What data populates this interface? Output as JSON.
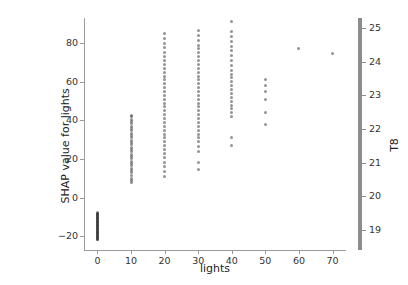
{
  "chart_data": {
    "type": "scatter",
    "title": "",
    "xlabel": "lights",
    "ylabel": "SHAP value for lights",
    "colorbar_label": "T8",
    "xlim": [
      -4,
      74
    ],
    "ylim": [
      -27,
      93
    ],
    "xticks": [
      0,
      10,
      20,
      30,
      40,
      50,
      60,
      70
    ],
    "xticklabels": [
      "0",
      "10",
      "20",
      "30",
      "40",
      "50",
      "60",
      "70"
    ],
    "yticks": [
      -20,
      0,
      20,
      40,
      60,
      80
    ],
    "yticklabels": [
      "−20",
      "0",
      "20",
      "40",
      "60",
      "80"
    ],
    "colorbar_ticks": [
      19,
      20,
      21,
      22,
      23,
      24,
      25
    ],
    "colorbar_ticklabels": [
      "19",
      "20",
      "21",
      "22",
      "23",
      "24",
      "25"
    ],
    "colorbar_range": [
      18.4,
      25.3
    ],
    "grid": false,
    "legend": false,
    "marker_color": "#3b3b3b",
    "marker_opacity": 0.55,
    "spine_color": "#9a9a9a",
    "series": [
      {
        "name": "SHAP values",
        "points": [
          {
            "x": 0,
            "y": -21.8,
            "c": 21.0
          },
          {
            "x": 0,
            "y": -21.4,
            "c": 20.4
          },
          {
            "x": 0,
            "y": -21.1,
            "c": 22.1
          },
          {
            "x": 0,
            "y": -20.8,
            "c": 19.8
          },
          {
            "x": 0,
            "y": -20.5,
            "c": 23.0
          },
          {
            "x": 0,
            "y": -20.2,
            "c": 21.5
          },
          {
            "x": 0,
            "y": -19.9,
            "c": 20.1
          },
          {
            "x": 0,
            "y": -19.6,
            "c": 22.7
          },
          {
            "x": 0,
            "y": -19.3,
            "c": 19.4
          },
          {
            "x": 0,
            "y": -19.0,
            "c": 23.6
          },
          {
            "x": 0,
            "y": -18.7,
            "c": 21.8
          },
          {
            "x": 0,
            "y": -18.4,
            "c": 20.7
          },
          {
            "x": 0,
            "y": -18.1,
            "c": 22.3
          },
          {
            "x": 0,
            "y": -17.8,
            "c": 19.1
          },
          {
            "x": 0,
            "y": -17.5,
            "c": 24.1
          },
          {
            "x": 0,
            "y": -17.2,
            "c": 21.2
          },
          {
            "x": 0,
            "y": -16.9,
            "c": 20.9
          },
          {
            "x": 0,
            "y": -16.6,
            "c": 22.9
          },
          {
            "x": 0,
            "y": -16.3,
            "c": 19.7
          },
          {
            "x": 0,
            "y": -16.0,
            "c": 23.3
          },
          {
            "x": 0,
            "y": -15.7,
            "c": 21.6
          },
          {
            "x": 0,
            "y": -15.4,
            "c": 20.3
          },
          {
            "x": 0,
            "y": -15.1,
            "c": 22.5
          },
          {
            "x": 0,
            "y": -14.8,
            "c": 19.5
          },
          {
            "x": 0,
            "y": -14.5,
            "c": 24.4
          },
          {
            "x": 0,
            "y": -14.2,
            "c": 21.1
          },
          {
            "x": 0,
            "y": -13.9,
            "c": 20.6
          },
          {
            "x": 0,
            "y": -13.6,
            "c": 23.1
          },
          {
            "x": 0,
            "y": -13.3,
            "c": 19.9
          },
          {
            "x": 0,
            "y": -13.0,
            "c": 22.0
          },
          {
            "x": 0,
            "y": -12.7,
            "c": 21.4
          },
          {
            "x": 0,
            "y": -12.4,
            "c": 20.0
          },
          {
            "x": 0,
            "y": -12.1,
            "c": 23.8
          },
          {
            "x": 0,
            "y": -11.8,
            "c": 19.2
          },
          {
            "x": 0,
            "y": -11.5,
            "c": 22.4
          },
          {
            "x": 0,
            "y": -11.2,
            "c": 21.7
          },
          {
            "x": 0,
            "y": -10.9,
            "c": 20.5
          },
          {
            "x": 0,
            "y": -10.6,
            "c": 23.4
          },
          {
            "x": 0,
            "y": -10.3,
            "c": 19.6
          },
          {
            "x": 0,
            "y": -10.0,
            "c": 22.2
          },
          {
            "x": 0,
            "y": -9.7,
            "c": 21.3
          },
          {
            "x": 0,
            "y": -9.4,
            "c": 20.8
          },
          {
            "x": 0,
            "y": -9.1,
            "c": 24.0
          },
          {
            "x": 0,
            "y": -8.8,
            "c": 19.3
          },
          {
            "x": 0,
            "y": -8.5,
            "c": 22.6
          },
          {
            "x": 0,
            "y": -8.2,
            "c": 21.9
          },
          {
            "x": 0,
            "y": -7.9,
            "c": 20.2
          },
          {
            "x": 0,
            "y": -7.6,
            "c": 23.2
          },
          {
            "x": 10,
            "y": 7.8,
            "c": 20.1
          },
          {
            "x": 10,
            "y": 9.0,
            "c": 21.3
          },
          {
            "x": 10,
            "y": 10.1,
            "c": 22.0
          },
          {
            "x": 10,
            "y": 11.5,
            "c": 19.8
          },
          {
            "x": 10,
            "y": 13.0,
            "c": 23.1
          },
          {
            "x": 10,
            "y": 14.2,
            "c": 20.6
          },
          {
            "x": 10,
            "y": 15.4,
            "c": 21.8
          },
          {
            "x": 10,
            "y": 16.6,
            "c": 22.5
          },
          {
            "x": 10,
            "y": 17.8,
            "c": 19.4
          },
          {
            "x": 10,
            "y": 19.0,
            "c": 23.5
          },
          {
            "x": 10,
            "y": 20.2,
            "c": 21.0
          },
          {
            "x": 10,
            "y": 21.4,
            "c": 20.4
          },
          {
            "x": 10,
            "y": 22.6,
            "c": 22.8
          },
          {
            "x": 10,
            "y": 23.8,
            "c": 19.6
          },
          {
            "x": 10,
            "y": 25.0,
            "c": 21.5
          },
          {
            "x": 10,
            "y": 26.2,
            "c": 23.0
          },
          {
            "x": 10,
            "y": 27.4,
            "c": 20.9
          },
          {
            "x": 10,
            "y": 28.6,
            "c": 22.2
          },
          {
            "x": 10,
            "y": 29.8,
            "c": 19.9
          },
          {
            "x": 10,
            "y": 31.0,
            "c": 21.7
          },
          {
            "x": 10,
            "y": 32.2,
            "c": 23.3
          },
          {
            "x": 10,
            "y": 33.4,
            "c": 20.3
          },
          {
            "x": 10,
            "y": 34.6,
            "c": 22.6
          },
          {
            "x": 10,
            "y": 35.8,
            "c": 19.5
          },
          {
            "x": 10,
            "y": 37.0,
            "c": 21.2
          },
          {
            "x": 10,
            "y": 38.2,
            "c": 23.7
          },
          {
            "x": 10,
            "y": 39.4,
            "c": 20.7
          },
          {
            "x": 10,
            "y": 40.6,
            "c": 22.1
          },
          {
            "x": 10,
            "y": 41.8,
            "c": 21.9
          },
          {
            "x": 10,
            "y": 42.6,
            "c": 20.0
          },
          {
            "x": 20,
            "y": 11.0,
            "c": 20.2
          },
          {
            "x": 20,
            "y": 13.5,
            "c": 21.4
          },
          {
            "x": 20,
            "y": 16.0,
            "c": 19.7
          },
          {
            "x": 20,
            "y": 18.5,
            "c": 22.3
          },
          {
            "x": 20,
            "y": 21.0,
            "c": 20.8
          },
          {
            "x": 20,
            "y": 23.0,
            "c": 23.1
          },
          {
            "x": 20,
            "y": 25.0,
            "c": 21.1
          },
          {
            "x": 20,
            "y": 27.0,
            "c": 19.9
          },
          {
            "x": 20,
            "y": 29.0,
            "c": 22.7
          },
          {
            "x": 20,
            "y": 31.0,
            "c": 20.5
          },
          {
            "x": 20,
            "y": 33.0,
            "c": 21.8
          },
          {
            "x": 20,
            "y": 35.0,
            "c": 23.4
          },
          {
            "x": 20,
            "y": 37.0,
            "c": 19.4
          },
          {
            "x": 20,
            "y": 39.0,
            "c": 22.0
          },
          {
            "x": 20,
            "y": 41.0,
            "c": 21.3
          },
          {
            "x": 20,
            "y": 43.0,
            "c": 20.6
          },
          {
            "x": 20,
            "y": 45.0,
            "c": 23.0
          },
          {
            "x": 20,
            "y": 47.0,
            "c": 19.6
          },
          {
            "x": 20,
            "y": 49.0,
            "c": 22.5
          },
          {
            "x": 20,
            "y": 51.0,
            "c": 21.6
          },
          {
            "x": 20,
            "y": 53.0,
            "c": 20.1
          },
          {
            "x": 20,
            "y": 55.0,
            "c": 23.6
          },
          {
            "x": 20,
            "y": 57.0,
            "c": 21.0
          },
          {
            "x": 20,
            "y": 59.0,
            "c": 22.2
          },
          {
            "x": 20,
            "y": 61.0,
            "c": 19.8
          },
          {
            "x": 20,
            "y": 63.0,
            "c": 21.9
          },
          {
            "x": 20,
            "y": 65.0,
            "c": 23.2
          },
          {
            "x": 20,
            "y": 67.0,
            "c": 20.4
          },
          {
            "x": 20,
            "y": 69.0,
            "c": 22.8
          },
          {
            "x": 20,
            "y": 71.0,
            "c": 21.2
          },
          {
            "x": 20,
            "y": 73.0,
            "c": 19.5
          },
          {
            "x": 20,
            "y": 75.0,
            "c": 22.9
          },
          {
            "x": 20,
            "y": 77.5,
            "c": 20.9
          },
          {
            "x": 20,
            "y": 80.0,
            "c": 23.8
          },
          {
            "x": 20,
            "y": 82.5,
            "c": 21.5
          },
          {
            "x": 20,
            "y": 85.0,
            "c": 22.4
          },
          {
            "x": 30,
            "y": 14.5,
            "c": 20.0
          },
          {
            "x": 30,
            "y": 18.5,
            "c": 21.6
          },
          {
            "x": 30,
            "y": 24.0,
            "c": 19.8
          },
          {
            "x": 30,
            "y": 26.5,
            "c": 22.4
          },
          {
            "x": 30,
            "y": 29.0,
            "c": 20.7
          },
          {
            "x": 30,
            "y": 31.0,
            "c": 23.2
          },
          {
            "x": 30,
            "y": 33.0,
            "c": 21.2
          },
          {
            "x": 30,
            "y": 35.0,
            "c": 19.9
          },
          {
            "x": 30,
            "y": 37.0,
            "c": 22.8
          },
          {
            "x": 30,
            "y": 39.0,
            "c": 20.6
          },
          {
            "x": 30,
            "y": 41.0,
            "c": 21.9
          },
          {
            "x": 30,
            "y": 43.0,
            "c": 23.5
          },
          {
            "x": 30,
            "y": 45.0,
            "c": 19.3
          },
          {
            "x": 30,
            "y": 47.0,
            "c": 22.1
          },
          {
            "x": 30,
            "y": 49.0,
            "c": 21.4
          },
          {
            "x": 30,
            "y": 51.0,
            "c": 20.5
          },
          {
            "x": 30,
            "y": 53.0,
            "c": 23.1
          },
          {
            "x": 30,
            "y": 55.0,
            "c": 19.7
          },
          {
            "x": 30,
            "y": 57.0,
            "c": 22.6
          },
          {
            "x": 30,
            "y": 59.0,
            "c": 21.7
          },
          {
            "x": 30,
            "y": 61.0,
            "c": 20.2
          },
          {
            "x": 30,
            "y": 63.0,
            "c": 23.7
          },
          {
            "x": 30,
            "y": 65.0,
            "c": 21.1
          },
          {
            "x": 30,
            "y": 67.0,
            "c": 22.3
          },
          {
            "x": 30,
            "y": 69.0,
            "c": 19.9
          },
          {
            "x": 30,
            "y": 71.0,
            "c": 22.0
          },
          {
            "x": 30,
            "y": 73.0,
            "c": 23.3
          },
          {
            "x": 30,
            "y": 75.0,
            "c": 20.8
          },
          {
            "x": 30,
            "y": 77.0,
            "c": 22.9
          },
          {
            "x": 30,
            "y": 79.0,
            "c": 21.3
          },
          {
            "x": 30,
            "y": 81.5,
            "c": 19.6
          },
          {
            "x": 30,
            "y": 84.0,
            "c": 23.0
          },
          {
            "x": 30,
            "y": 86.5,
            "c": 21.8
          },
          {
            "x": 40,
            "y": 27.0,
            "c": 20.3
          },
          {
            "x": 40,
            "y": 31.0,
            "c": 21.5
          },
          {
            "x": 40,
            "y": 42.0,
            "c": 19.9
          },
          {
            "x": 40,
            "y": 44.0,
            "c": 22.6
          },
          {
            "x": 40,
            "y": 46.0,
            "c": 20.8
          },
          {
            "x": 40,
            "y": 48.0,
            "c": 23.3
          },
          {
            "x": 40,
            "y": 50.0,
            "c": 21.0
          },
          {
            "x": 40,
            "y": 52.0,
            "c": 19.5
          },
          {
            "x": 40,
            "y": 54.0,
            "c": 22.2
          },
          {
            "x": 40,
            "y": 56.0,
            "c": 20.4
          },
          {
            "x": 40,
            "y": 58.0,
            "c": 21.7
          },
          {
            "x": 40,
            "y": 60.0,
            "c": 23.6
          },
          {
            "x": 40,
            "y": 62.0,
            "c": 19.8
          },
          {
            "x": 40,
            "y": 64.0,
            "c": 22.5
          },
          {
            "x": 40,
            "y": 66.0,
            "c": 21.2
          },
          {
            "x": 40,
            "y": 68.5,
            "c": 20.7
          },
          {
            "x": 40,
            "y": 71.0,
            "c": 23.0
          },
          {
            "x": 40,
            "y": 73.5,
            "c": 19.4
          },
          {
            "x": 40,
            "y": 76.0,
            "c": 22.7
          },
          {
            "x": 40,
            "y": 78.5,
            "c": 21.6
          },
          {
            "x": 40,
            "y": 81.0,
            "c": 20.1
          },
          {
            "x": 40,
            "y": 83.5,
            "c": 23.4
          },
          {
            "x": 40,
            "y": 86.0,
            "c": 21.9
          },
          {
            "x": 40,
            "y": 91.0,
            "c": 22.3
          },
          {
            "x": 50,
            "y": 38.0,
            "c": 21.1
          },
          {
            "x": 50,
            "y": 44.0,
            "c": 22.4
          },
          {
            "x": 50,
            "y": 51.0,
            "c": 20.6
          },
          {
            "x": 50,
            "y": 55.0,
            "c": 23.1
          },
          {
            "x": 50,
            "y": 58.0,
            "c": 21.8
          },
          {
            "x": 50,
            "y": 61.0,
            "c": 19.9
          },
          {
            "x": 60,
            "y": 77.0,
            "c": 23.9
          },
          {
            "x": 70,
            "y": 74.5,
            "c": 24.0
          }
        ]
      }
    ]
  }
}
